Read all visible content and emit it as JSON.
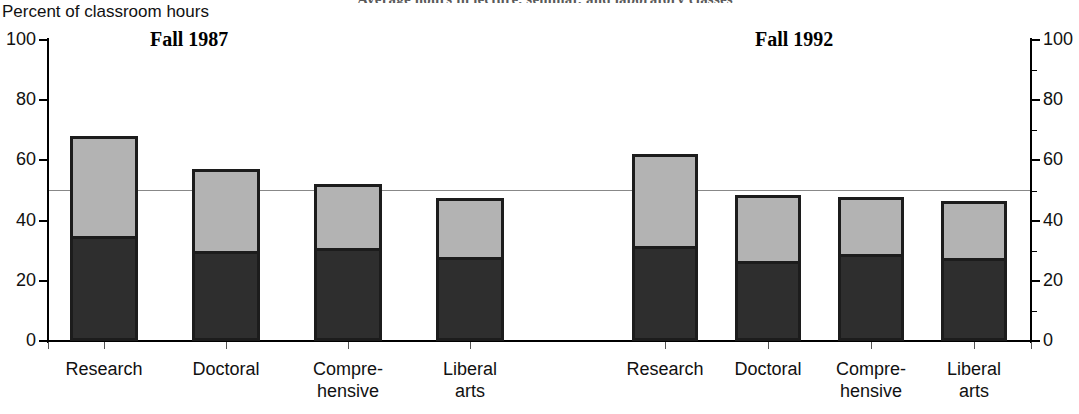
{
  "title_cropped": "Average hours in lecture, seminar, and laboratory classes",
  "axis": {
    "y_title": "Percent of classroom hours",
    "left_ticks": [
      "100",
      "80",
      "60",
      "40",
      "20",
      "0"
    ],
    "right_ticks": [
      "100",
      "80",
      "60",
      "40",
      "20",
      "0"
    ]
  },
  "panels": [
    {
      "label": "Fall 1987"
    },
    {
      "label": "Fall 1992"
    }
  ],
  "categories": [
    "Research",
    "Doctoral",
    "Compre-\nhensive",
    "Liberal\narts"
  ],
  "chart_data": {
    "type": "bar",
    "subtype": "stacked-bar-grouped-panels",
    "title": "Average hours in lecture, seminar, and laboratory classes",
    "ylabel": "Percent of classroom hours",
    "xlabel": "",
    "ylim": [
      0,
      100
    ],
    "ytick_step": 20,
    "yticks": [
      0,
      20,
      40,
      60,
      80,
      100
    ],
    "dual_y_axis": true,
    "grid": false,
    "reference_line": 50,
    "legend": "none",
    "panels": [
      {
        "name": "Fall 1987",
        "categories": [
          "Research",
          "Doctoral",
          "Comprehensive",
          "Liberal arts"
        ],
        "series": [
          {
            "name": "lower-segment",
            "color": "#2e2e2e",
            "values": [
              34,
              29,
              30,
              27
            ]
          },
          {
            "name": "upper-segment",
            "color": "#b3b3b3",
            "values": [
              34,
              28,
              22,
              20.5
            ]
          }
        ],
        "totals": [
          68,
          57,
          52,
          47.5
        ]
      },
      {
        "name": "Fall 1992",
        "categories": [
          "Research",
          "Doctoral",
          "Comprehensive",
          "Liberal arts"
        ],
        "series": [
          {
            "name": "lower-segment",
            "color": "#2e2e2e",
            "values": [
              30.5,
              25.5,
              28,
              26.5
            ]
          },
          {
            "name": "upper-segment",
            "color": "#b3b3b3",
            "values": [
              31.5,
              23,
              20,
              20
            ]
          }
        ],
        "totals": [
          62,
          48.5,
          48,
          46.5
        ]
      }
    ]
  }
}
